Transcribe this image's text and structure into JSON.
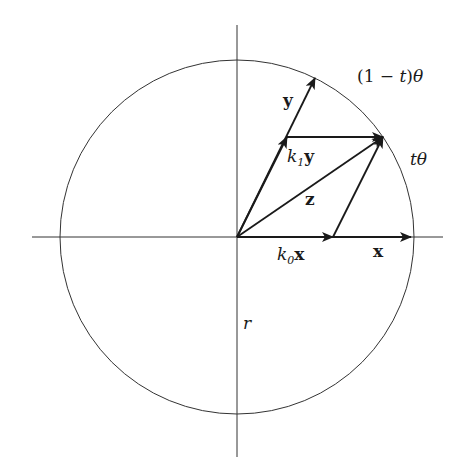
{
  "diagram": {
    "type": "vector-geometry",
    "description_visible": "Unit circle with axes, vectors x, y, z and parallelogram decomposition",
    "colors": {
      "stroke": "#1a1a1a",
      "axis": "#333333",
      "background": "#ffffff"
    },
    "circle": {
      "cx": 237,
      "cy": 237,
      "r": 177
    },
    "axes": {
      "horizontal": {
        "x1": 32,
        "y1": 237,
        "x2": 443,
        "y2": 237
      },
      "vertical": {
        "x1": 237,
        "y1": 25,
        "x2": 237,
        "y2": 457
      }
    },
    "vectors": [
      {
        "id": "x",
        "from": [
          237,
          237
        ],
        "to": [
          411,
          237
        ]
      },
      {
        "id": "k0x",
        "from": [
          237,
          237
        ],
        "to": [
          333,
          237
        ]
      },
      {
        "id": "y",
        "from": [
          237,
          237
        ],
        "to": [
          315,
          78
        ]
      },
      {
        "id": "k1y",
        "from": [
          237,
          237
        ],
        "to": [
          287,
          137
        ]
      },
      {
        "id": "z",
        "from": [
          237,
          237
        ],
        "to": [
          383,
          137
        ]
      },
      {
        "id": "k1y-to-z",
        "from": [
          287,
          137
        ],
        "to": [
          383,
          137
        ]
      },
      {
        "id": "k0x-to-z",
        "from": [
          333,
          237
        ],
        "to": [
          383,
          137
        ]
      }
    ],
    "labels": {
      "x": "x",
      "y": "y",
      "z": "z",
      "k0x": {
        "k": "k",
        "sub": "0",
        "vec": "x"
      },
      "k1y": {
        "k": "k",
        "sub": "1",
        "vec": "y"
      },
      "one_minus_t_theta": {
        "open": "(1 − ",
        "t": "t",
        "close": ")",
        "theta": "θ"
      },
      "t_theta": {
        "t": "t",
        "theta": "θ"
      },
      "r": "r"
    }
  }
}
